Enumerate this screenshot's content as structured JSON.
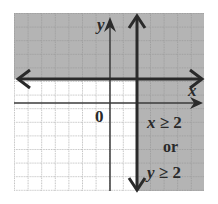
{
  "figure": {
    "type": "inequality-graph",
    "labels": {
      "x_axis": "x",
      "y_axis": "y",
      "origin": "0",
      "inequality_line1": "x ≥ 2",
      "connector": "or",
      "inequality_line2": "y ≥ 2"
    },
    "colors": {
      "shade": "#b4b4b4",
      "grid": "#8a8a8a",
      "axis": "#3a3a3a",
      "boundary": "#2a2a2a",
      "background": "#ffffff"
    },
    "grid": {
      "x_min": -7,
      "x_max": 7,
      "y_min": -7,
      "y_max": 7
    },
    "boundaries": [
      {
        "equation": "x = 2",
        "style": "solid"
      },
      {
        "equation": "y = 2",
        "style": "solid"
      }
    ],
    "shaded_region": "x >= 2 OR y >= 2"
  }
}
